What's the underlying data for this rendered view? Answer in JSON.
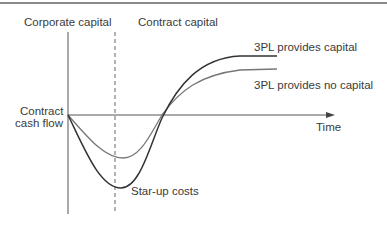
{
  "diagram": {
    "regions": {
      "left": "Corporate capital",
      "right": "Contract capital"
    },
    "y_axis_label_line1": "Contract",
    "y_axis_label_line2": "cash flow",
    "x_axis_label": "Time",
    "curves": [
      {
        "name": "3PL provides capital",
        "color": "#3c3c3c"
      },
      {
        "name": "3PL provides no capital",
        "color": "#6e6e6e"
      }
    ],
    "annotation": "Star-up costs"
  }
}
